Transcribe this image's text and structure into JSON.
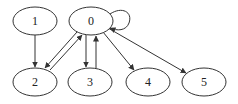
{
  "graph": {
    "nodes": [
      {
        "id": "0",
        "label": "0",
        "cx": 91,
        "cy": 21
      },
      {
        "id": "1",
        "label": "1",
        "cx": 35,
        "cy": 21
      },
      {
        "id": "2",
        "label": "2",
        "cx": 35,
        "cy": 82
      },
      {
        "id": "3",
        "label": "3",
        "cx": 90,
        "cy": 82
      },
      {
        "id": "4",
        "label": "4",
        "cx": 148,
        "cy": 82
      },
      {
        "id": "5",
        "label": "5",
        "cx": 204,
        "cy": 82
      }
    ],
    "edges": [
      {
        "from": "1",
        "to": "2"
      },
      {
        "from": "0",
        "to": "2"
      },
      {
        "from": "2",
        "to": "0"
      },
      {
        "from": "0",
        "to": "3"
      },
      {
        "from": "3",
        "to": "0"
      },
      {
        "from": "0",
        "to": "4"
      },
      {
        "from": "0",
        "to": "5"
      },
      {
        "from": "0",
        "to": "0"
      }
    ],
    "colors": {
      "stroke": "#333333",
      "fill": "#ffffff"
    }
  }
}
